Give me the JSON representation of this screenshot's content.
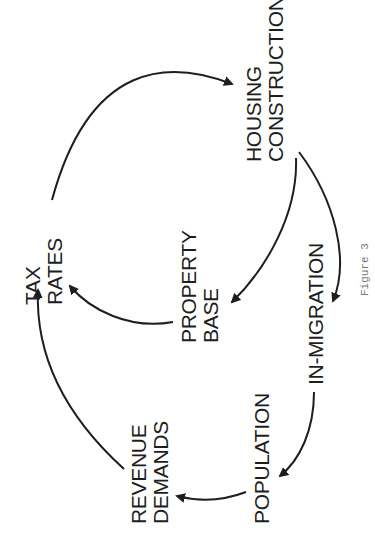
{
  "diagram": {
    "nodes": [
      {
        "id": "housing",
        "label": "HOUSING\nCONSTRUCTION"
      },
      {
        "id": "tax",
        "label": "TAX\nRATES"
      },
      {
        "id": "property",
        "label": "PROPERTY\nBASE"
      },
      {
        "id": "inmig",
        "label": "IN-MIGRATION"
      },
      {
        "id": "population",
        "label": "POPULATION"
      },
      {
        "id": "revenue",
        "label": "REVENUE\nDEMANDS"
      }
    ],
    "edges": [
      {
        "from": "TAX RATES",
        "to": "HOUSING CONSTRUCTION"
      },
      {
        "from": "HOUSING CONSTRUCTION",
        "to": "PROPERTY BASE"
      },
      {
        "from": "HOUSING CONSTRUCTION",
        "to": "IN-MIGRATION"
      },
      {
        "from": "PROPERTY BASE",
        "to": "TAX RATES"
      },
      {
        "from": "IN-MIGRATION",
        "to": "POPULATION"
      },
      {
        "from": "POPULATION",
        "to": "REVENUE DEMANDS"
      },
      {
        "from": "REVENUE DEMANDS",
        "to": "TAX RATES"
      }
    ],
    "caption": "Figure 3",
    "colors": {
      "ink": "#1e1e1e",
      "caption": "#777777",
      "background": "#ffffff"
    }
  }
}
